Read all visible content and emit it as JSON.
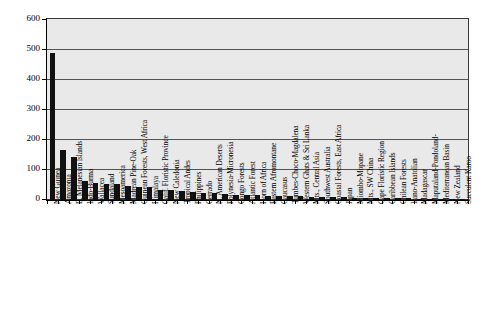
{
  "chart_data": {
    "type": "bar",
    "title": "",
    "subtitle": "",
    "xlabel": "",
    "ylabel": "",
    "ylim": [
      0,
      600
    ],
    "ytick_labels": [
      "600",
      "500",
      "400",
      "300",
      "200",
      "100",
      "0"
    ],
    "ytick_values": [
      600,
      500,
      400,
      300,
      200,
      100,
      0
    ],
    "grid": true,
    "legend": "none",
    "bar_color": "#111111",
    "plot_background": "#e9e9e9",
    "categories": [
      "New Guinea",
      "Amazonia",
      "E. Melanesian Islands",
      "Indo-Burma",
      "Wallacea",
      "Sundaland",
      "Mesoamerica",
      "Madrean Pine-Oak",
      "Guinean Forests, West Africa",
      "Himalaya",
      "Calif. Floristic Province",
      "New Caledonia",
      "Tropical Andes",
      "Philippines",
      "Cerrado",
      "N. American Deserts",
      "Polynesia-Micronesia",
      "Congo Forests",
      "Atlantic Forest",
      "Horn of Africa",
      "Eastern Afromontane",
      "Caucasus",
      "Tumbes-Choco-Magdalena",
      "Western Ghats & Sri Lanka",
      "Mts., Central Asia",
      "Southwest Australia",
      "Coastal Forests, East Africa",
      "Japan",
      "Miombo-Mopane",
      "Mts., SW China",
      "Cape Floristic Region",
      "Caribbean Islands",
      "Chilean Forests",
      "Irano-Anatolian",
      "Madagascar",
      "Maputaland-Pondoland-",
      "Mediterranean Basin",
      "New Zealand",
      "Succulent Karoo"
    ],
    "values": [
      490,
      168,
      142,
      62,
      56,
      55,
      52,
      48,
      45,
      43,
      33,
      32,
      30,
      28,
      24,
      22,
      20,
      18,
      17,
      16,
      15,
      14,
      13,
      12,
      11,
      10,
      10,
      9,
      8,
      8,
      7,
      7,
      6,
      6,
      5,
      5,
      4,
      4,
      3
    ]
  }
}
